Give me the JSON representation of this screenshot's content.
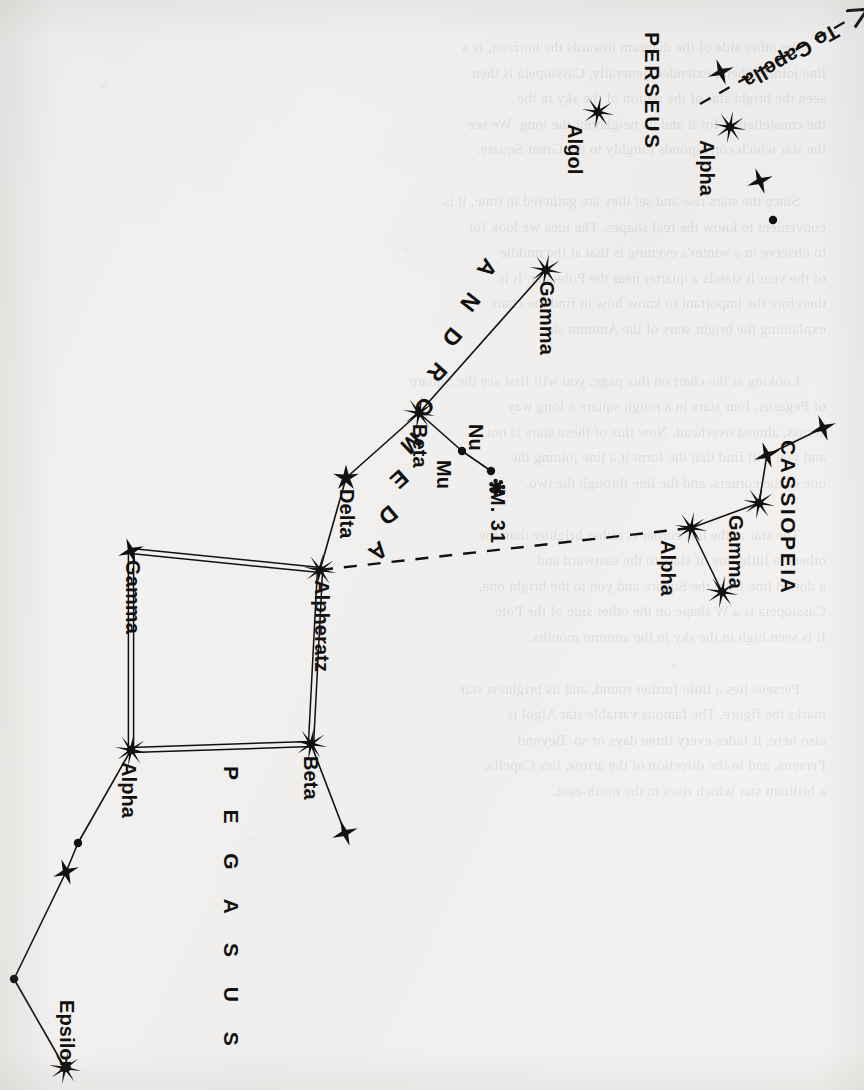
{
  "page": {
    "kind": "star-chart",
    "orientation": "rotated-90-clockwise",
    "paper_color": "#f2f1ef",
    "ink_color": "#111111",
    "title_visible": false
  },
  "constellations": [
    {
      "id": "pegasus",
      "label": "P E G A S U S",
      "label_raw": "PEGASUS"
    },
    {
      "id": "andromeda",
      "label": "ANDROMEDA",
      "label_raw": "ANDROMEDA"
    },
    {
      "id": "cassiopeia",
      "label": "CASSIOPEIA",
      "label_raw": "CASSIOPEIA"
    },
    {
      "id": "perseus",
      "label": "PERSEUS",
      "label_raw": "PERSEUS"
    }
  ],
  "annotations": {
    "to_capella": "To Capella",
    "m31": "M. 31"
  },
  "star_labels": {
    "peg_alpha": "Alpha",
    "peg_beta": "Beta",
    "peg_gamma": "Gamma",
    "peg_epsilon": "Epsilon",
    "and_alpheratz": "Alpheratz",
    "and_delta": "Delta",
    "and_beta": "Beta",
    "and_gamma": "Gamma",
    "and_mu": "Mu",
    "and_nu": "Nu",
    "cas_alpha": "Alpha",
    "cas_gamma": "Gamma",
    "per_alpha": "Alpha",
    "per_algol": "Algol"
  },
  "chart_data": {
    "type": "scatter",
    "xlabel": "",
    "ylabel": "",
    "grid": false,
    "legend": "none",
    "note": "Positions are screen pixel coordinates in the 864x1090 scanned image. 'mag_class' encodes the drawn symbol: 8 = large 8-point burst (brightest), 5 = 5-point star, 4 = small 4-point star, 1 = plain dot.",
    "stars": [
      {
        "id": "peg_gamma",
        "label": "Gamma",
        "constellation": "Pegasus",
        "x": 131,
        "y": 551,
        "mag_class": 4
      },
      {
        "id": "and_alpheratz",
        "label": "Alpheratz",
        "constellation": "Andromeda",
        "x": 320,
        "y": 570,
        "mag_class": 8
      },
      {
        "id": "peg_alpha",
        "label": "Alpha",
        "constellation": "Pegasus",
        "x": 131,
        "y": 750,
        "mag_class": 8
      },
      {
        "id": "peg_beta",
        "label": "Beta",
        "constellation": "Pegasus",
        "x": 311,
        "y": 744,
        "mag_class": 8
      },
      {
        "id": "peg_beta_sw",
        "label": "",
        "constellation": "Pegasus",
        "x": 345,
        "y": 833,
        "mag_class": 4
      },
      {
        "id": "peg_chain_1",
        "label": "",
        "constellation": "Pegasus",
        "x": 78,
        "y": 843,
        "mag_class": 1
      },
      {
        "id": "peg_chain_2",
        "label": "",
        "constellation": "Pegasus",
        "x": 66,
        "y": 872,
        "mag_class": 4
      },
      {
        "id": "peg_chain_3",
        "label": "",
        "constellation": "Pegasus",
        "x": 14,
        "y": 979,
        "mag_class": 1
      },
      {
        "id": "peg_epsilon",
        "label": "Epsilon",
        "constellation": "Pegasus",
        "x": 65,
        "y": 1068,
        "mag_class": 8
      },
      {
        "id": "and_delta",
        "label": "Delta",
        "constellation": "Andromeda",
        "x": 346,
        "y": 478,
        "mag_class": 5
      },
      {
        "id": "and_beta",
        "label": "Beta",
        "constellation": "Andromeda",
        "x": 419,
        "y": 413,
        "mag_class": 8
      },
      {
        "id": "and_gamma",
        "label": "Gamma",
        "constellation": "Andromeda",
        "x": 546,
        "y": 270,
        "mag_class": 8
      },
      {
        "id": "and_mu",
        "label": "Mu",
        "constellation": "Andromeda",
        "x": 462,
        "y": 451,
        "mag_class": 1
      },
      {
        "id": "and_nu",
        "label": "Nu",
        "constellation": "Andromeda",
        "x": 491,
        "y": 471,
        "mag_class": 1
      },
      {
        "id": "m31",
        "label": "M. 31",
        "constellation": "Andromeda",
        "x": 497,
        "y": 487,
        "mag_class": 0
      },
      {
        "id": "cas_alpha",
        "label": "Alpha",
        "constellation": "Cassiopeia",
        "x": 691,
        "y": 528,
        "mag_class": 8
      },
      {
        "id": "cas_beta",
        "label": "",
        "constellation": "Cassiopeia",
        "x": 722,
        "y": 592,
        "mag_class": 8
      },
      {
        "id": "cas_gamma",
        "label": "Gamma",
        "constellation": "Cassiopeia",
        "x": 759,
        "y": 503,
        "mag_class": 8
      },
      {
        "id": "cas_delta",
        "label": "",
        "constellation": "Cassiopeia",
        "x": 767,
        "y": 455,
        "mag_class": 4
      },
      {
        "id": "cas_epsilon",
        "label": "",
        "constellation": "Cassiopeia",
        "x": 823,
        "y": 428,
        "mag_class": 4
      },
      {
        "id": "per_algol",
        "label": "Algol",
        "constellation": "Perseus",
        "x": 598,
        "y": 112,
        "mag_class": 8
      },
      {
        "id": "per_alpha",
        "label": "Alpha",
        "constellation": "Perseus",
        "x": 730,
        "y": 127,
        "mag_class": 8
      },
      {
        "id": "per_up",
        "label": "",
        "constellation": "Perseus",
        "x": 721,
        "y": 72,
        "mag_class": 4
      },
      {
        "id": "per_low",
        "label": "",
        "constellation": "Perseus",
        "x": 760,
        "y": 181,
        "mag_class": 4
      },
      {
        "id": "per_dot",
        "label": "",
        "constellation": "Perseus",
        "x": 773,
        "y": 220,
        "mag_class": 1
      }
    ],
    "lines": [
      {
        "from": "peg_gamma",
        "to": "and_alpheratz",
        "style": "double"
      },
      {
        "from": "and_alpheratz",
        "to": "peg_beta",
        "style": "double"
      },
      {
        "from": "peg_beta",
        "to": "peg_alpha",
        "style": "double"
      },
      {
        "from": "peg_alpha",
        "to": "peg_gamma",
        "style": "double"
      },
      {
        "from": "peg_beta",
        "to": "peg_beta_sw",
        "style": "solid"
      },
      {
        "from": "peg_alpha",
        "to": "peg_chain_1",
        "style": "solid"
      },
      {
        "from": "peg_chain_1",
        "to": "peg_chain_2",
        "style": "solid"
      },
      {
        "from": "peg_chain_2",
        "to": "peg_chain_3",
        "style": "solid"
      },
      {
        "from": "peg_chain_3",
        "to": "peg_epsilon",
        "style": "solid"
      },
      {
        "from": "and_alpheratz",
        "to": "and_delta",
        "style": "solid"
      },
      {
        "from": "and_delta",
        "to": "and_beta",
        "style": "solid"
      },
      {
        "from": "and_beta",
        "to": "and_gamma",
        "style": "solid"
      },
      {
        "from": "and_beta",
        "to": "and_mu",
        "style": "solid"
      },
      {
        "from": "and_mu",
        "to": "and_nu",
        "style": "solid"
      },
      {
        "from": "cas_alpha",
        "to": "cas_gamma",
        "style": "solid"
      },
      {
        "from": "cas_alpha",
        "to": "cas_beta",
        "style": "solid"
      },
      {
        "from": "cas_gamma",
        "to": "cas_delta",
        "style": "solid"
      },
      {
        "from": "cas_delta",
        "to": "cas_epsilon",
        "style": "solid"
      },
      {
        "from": "and_alpheratz",
        "to": "cas_alpha",
        "style": "dashed"
      }
    ],
    "arrows": [
      {
        "id": "to-capella-arrow",
        "label": "To Capella",
        "from_x": 700,
        "from_y": 104,
        "to_x": 852,
        "to_y": 18,
        "style": "dashed"
      }
    ]
  },
  "showthrough_text": {
    "note": "faint mirrored bleed-through of printed text on the reverse of the page",
    "paragraphs": [
      [
        "the other side of the diagram towards the horizon, is a",
        "line joining them, extended generally, Cassiopeia is then",
        "seen the bright star of the region of the sky in the",
        "the constellation for it and its neighbour the long. We see",
        "the star which corresponds roughly to the Great Square."
      ],
      [
        "Since the stars rise and set they are gathered in time, it is",
        "convenient to know the real shapes. The idea we look for",
        "to observe in a winter's evening is that at the middle",
        "of the year it stands a quarter near the Pole-star. It is",
        "therefore the important to know how to find the chart",
        "explaining the bright stars of the Autumn sky."
      ],
      [
        "Looking at the chart on this page, you will first see the Square",
        "of Pegasus, four stars in a rough square a long way",
        "across, almost overhead. Now this of these stars is not",
        "and you will find that the form it a line joining the",
        "one of the corners, and the line through the two."
      ],
      [
        "The star at the left corner is rather brighter than the",
        "others, a little line of stars to the eastward and",
        "a dotted line from the Square and you to the bright one.",
        "Cassiopeia is a W shape on the other side of the Pole.",
        "It is seen high in the sky in the autumn months."
      ],
      [
        "Perseus lies a little further round, and its brightest star",
        "marks the figure. The famous variable star Algol is",
        "also here; it fades every three days or so. Beyond",
        "Perseus, and in the direction of the arrow, lies Capella,",
        "a brilliant star which rises in the north-east."
      ]
    ]
  }
}
